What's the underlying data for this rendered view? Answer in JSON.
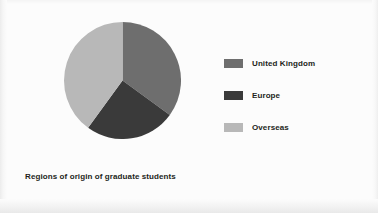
{
  "slide": {
    "background_color": "#fcfcfc",
    "caption": "Regions of origin of graduate students"
  },
  "legend": {
    "position": "right",
    "items": [
      {
        "label": "United Kingdom",
        "color": "#6e6e6e"
      },
      {
        "label": "Europe",
        "color": "#3a3a3a"
      },
      {
        "label": "Overseas",
        "color": "#b8b8b8"
      }
    ]
  },
  "chart_data": {
    "type": "pie",
    "title": "Regions of origin of graduate students",
    "subtitle": "",
    "xlabel": "",
    "ylabel": "",
    "grid": false,
    "legend_position": "right",
    "start_angle_deg": 0,
    "direction": "clockwise",
    "categories": [
      "United Kingdom",
      "Europe",
      "Overseas"
    ],
    "values": [
      35,
      25,
      40
    ],
    "unit": "percent",
    "colors": [
      "#6e6e6e",
      "#3a3a3a",
      "#b8b8b8"
    ],
    "slices": [
      {
        "label": "United Kingdom",
        "value": 35,
        "color": "#6e6e6e",
        "start_deg": 0,
        "end_deg": 126
      },
      {
        "label": "Europe",
        "value": 25,
        "color": "#3a3a3a",
        "start_deg": 126,
        "end_deg": 216
      },
      {
        "label": "Overseas",
        "value": 40,
        "color": "#b8b8b8",
        "start_deg": 216,
        "end_deg": 360
      }
    ],
    "annotations": []
  }
}
